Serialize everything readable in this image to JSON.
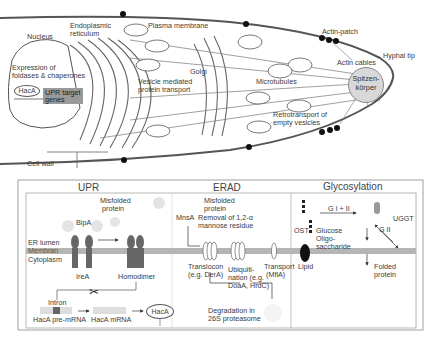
{
  "cell": {
    "nucleus": "Nucleus",
    "er": "Endoplasmic\nreticulum",
    "er_line1": "Endoplasmic",
    "er_line2": "reticulum",
    "plasma_membrane": "Plasma membrane",
    "actin_patch": "Actin-patch",
    "hyphal_tip": "Hyphal tip",
    "actin_cables": "Actin cables",
    "expression_line1": "Expression of",
    "expression_line2": "foldases & chaperones",
    "haca": "HacA",
    "upr_target_line1": "UPR target",
    "upr_target_line2": "genes",
    "vesicle_line1": "Vesicle  mediated",
    "vesicle_line2": "protein transport",
    "golgi": "Golgi",
    "microtubules": "Microtubules",
    "spitz_line1": "Spitzen-",
    "spitz_line2": "körper",
    "retro_line1": "Retrotransport of",
    "retro_line2": "empty vesicles",
    "cell_wall": "Cell wall"
  },
  "panels": {
    "upr": {
      "title": "UPR",
      "misfolded_line1": "Misfolded",
      "misfolded_line2": "protein",
      "bipa": "BipA",
      "er_lumen": "ER lumen",
      "membran": "Membran",
      "cytoplasm": "Cytoplasm",
      "irea": "IreA",
      "homodimer": "Homodimer",
      "intron": "Intron",
      "pre_mrna": "HacA pre-mRNA",
      "mrna": "HacA mRNA",
      "haca": "HacA"
    },
    "erad": {
      "title": "ERAD",
      "misfolded_line1": "Misfolded",
      "misfolded_line2": "protein",
      "mnsa": "MnsA",
      "removal_line1": "Removal of 1,2-α",
      "removal_line2": "mannose residue",
      "translocon_line1": "Translocon",
      "translocon_line2": "(e.g. DerA)",
      "ubiq_line1": "Ubiquiti-",
      "ubiq_line2": "nation (e.g.",
      "ubiq_line3": "DoaA, HrdC)",
      "transport_line1": "Transport",
      "transport_line2": "(MflA)",
      "degradation_line1": "Degradation in",
      "degradation_line2": "26S proteasome"
    },
    "glyco": {
      "title": "Glycosylation",
      "g1g2": "G I + II",
      "g2": "G II",
      "ugGT": "UGGT",
      "ost": "OST",
      "glucose": "Glucose",
      "oligo_line1": "Oligo-",
      "oligo_line2": "saccharide",
      "lipid": "Lipid",
      "cnx": "CNX",
      "folded_line1": "Folded",
      "folded_line2": "protein"
    }
  },
  "colors": {
    "membrane": "#b5b5b5",
    "receptor": "#666666",
    "spitzenkoerper": "#d8d8d8",
    "gene_box": "#9a9a9a"
  }
}
